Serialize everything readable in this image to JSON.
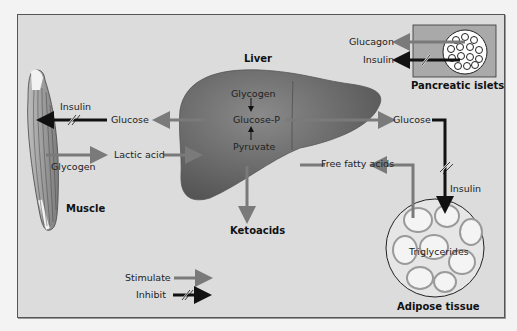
{
  "colors": {
    "background": "#dcdcdc",
    "liver": "#6f6f6f",
    "stimulate_arrow": "#7a7a7a",
    "inhibit_arrow": "#111111",
    "frame_border": "#555555"
  },
  "organs": {
    "liver": "Liver",
    "muscle": "Muscle",
    "pancreas": "Pancreatic islets",
    "adipose": "Adipose tissue"
  },
  "liver_pathway": {
    "top": "Glycogen",
    "middle": "Glucose-P",
    "bottom": "Pyruvate"
  },
  "labels": {
    "muscle_insulin": "Insulin",
    "muscle_glucose": "Glucose",
    "lactic_acid": "Lactic acid",
    "muscle_glycogen": "Glycogen",
    "ketoacids": "Ketoacids",
    "glucagon": "Glucagon",
    "pancreas_insulin": "Insulin",
    "liver_glucose_out": "Glucose",
    "free_fatty_acids": "Free fatty acids",
    "adipose_insulin": "Insulin",
    "triglycerides": "Triglycerides"
  },
  "legend": {
    "stimulate": "Stimulate",
    "inhibit": "Inhibit"
  }
}
